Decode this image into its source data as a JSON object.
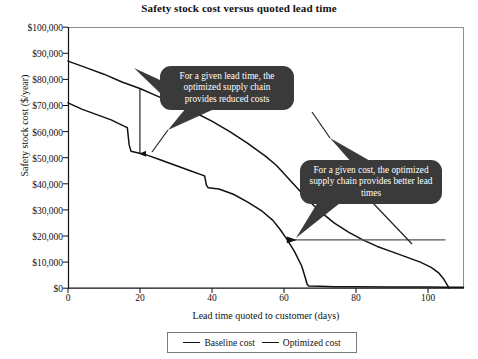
{
  "chart_data": {
    "type": "line",
    "title": "Safety stock cost versus quoted lead time",
    "xlabel": "Lead time quoted to customer (days)",
    "ylabel": "Safety stock cost ($/year)",
    "xlim": [
      0,
      110
    ],
    "ylim": [
      0,
      100000
    ],
    "grid": false,
    "legend_position": "bottom",
    "x_ticks": [
      {
        "value": 0,
        "label": "0"
      },
      {
        "value": 20,
        "label": "20"
      },
      {
        "value": 40,
        "label": "40"
      },
      {
        "value": 60,
        "label": "60"
      },
      {
        "value": 80,
        "label": "80"
      },
      {
        "value": 100,
        "label": "100"
      }
    ],
    "y_ticks": [
      {
        "value": 0,
        "label": "$0"
      },
      {
        "value": 10000,
        "label": "$10,000"
      },
      {
        "value": 20000,
        "label": "$20,000"
      },
      {
        "value": 30000,
        "label": "$30,000"
      },
      {
        "value": 40000,
        "label": "$40,000"
      },
      {
        "value": 50000,
        "label": "$50,000"
      },
      {
        "value": 60000,
        "label": "$60,000"
      },
      {
        "value": 70000,
        "label": "$70,000"
      },
      {
        "value": 80000,
        "label": "$80,000"
      },
      {
        "value": 90000,
        "label": "$90,000"
      },
      {
        "value": 100000,
        "label": "$100,000"
      }
    ],
    "series": [
      {
        "name": "Baseline cost",
        "color": "#111111",
        "points": [
          [
            0,
            87000
          ],
          [
            5,
            84500
          ],
          [
            10,
            82000
          ],
          [
            15,
            79000
          ],
          [
            20,
            76500
          ],
          [
            25,
            73500
          ],
          [
            30,
            70500
          ],
          [
            35,
            67500
          ],
          [
            40,
            64000
          ],
          [
            45,
            60000
          ],
          [
            50,
            55500
          ],
          [
            55,
            50500
          ],
          [
            58,
            47000
          ],
          [
            61,
            42500
          ],
          [
            64,
            38000
          ],
          [
            67,
            33500
          ],
          [
            70,
            29500
          ],
          [
            74,
            25000
          ],
          [
            78,
            21500
          ],
          [
            82,
            18500
          ],
          [
            86,
            16000
          ],
          [
            90,
            14000
          ],
          [
            94,
            12000
          ],
          [
            98,
            10000
          ],
          [
            101,
            8000
          ],
          [
            103,
            6000
          ],
          [
            104.5,
            3500
          ],
          [
            105.5,
            1200
          ],
          [
            106,
            0
          ]
        ]
      },
      {
        "name": "Optimized cost",
        "color": "#111111",
        "points": [
          [
            0,
            71000
          ],
          [
            4,
            68500
          ],
          [
            8,
            66500
          ],
          [
            12,
            64500
          ],
          [
            15,
            62500
          ],
          [
            16.5,
            61500
          ],
          [
            17,
            55000
          ],
          [
            17.5,
            52500
          ],
          [
            19,
            52000
          ],
          [
            22,
            51000
          ],
          [
            26,
            49000
          ],
          [
            30,
            47000
          ],
          [
            34,
            45000
          ],
          [
            37,
            43500
          ],
          [
            38,
            43000
          ],
          [
            38.5,
            39500
          ],
          [
            39,
            38500
          ],
          [
            42,
            38000
          ],
          [
            46,
            36000
          ],
          [
            50,
            33000
          ],
          [
            54,
            29500
          ],
          [
            57,
            26000
          ],
          [
            59,
            22500
          ],
          [
            61,
            18500
          ],
          [
            63,
            14000
          ],
          [
            65,
            8500
          ],
          [
            66,
            4000
          ],
          [
            66.5,
            1500
          ],
          [
            67,
            800
          ],
          [
            70,
            700
          ],
          [
            74,
            600
          ],
          [
            80,
            550
          ],
          [
            90,
            500
          ],
          [
            100,
            450
          ],
          [
            105,
            400
          ],
          [
            110,
            400
          ]
        ]
      }
    ],
    "annotations": [
      {
        "id": "callout-1",
        "text": "For a given lead time, the optimized supply chain provides reduced costs",
        "style": "dark-rounded-bubble"
      },
      {
        "id": "callout-2",
        "text": "For a given cost, the optimized supply chain provides better lead times",
        "style": "dark-rounded-bubble"
      },
      {
        "id": "vertical-cost-gap-arrow",
        "orientation": "vertical",
        "x": 20,
        "y_from": 76500,
        "y_to": 51500,
        "meaning": "cost reduction at fixed lead time"
      },
      {
        "id": "horizontal-leadtime-gap-arrow",
        "orientation": "horizontal",
        "y": 18500,
        "x_from": 105,
        "x_to": 61,
        "meaning": "lead time reduction at fixed cost"
      }
    ]
  },
  "legend": {
    "entries": [
      {
        "label": "Baseline cost"
      },
      {
        "label": "Optimized cost"
      }
    ]
  }
}
